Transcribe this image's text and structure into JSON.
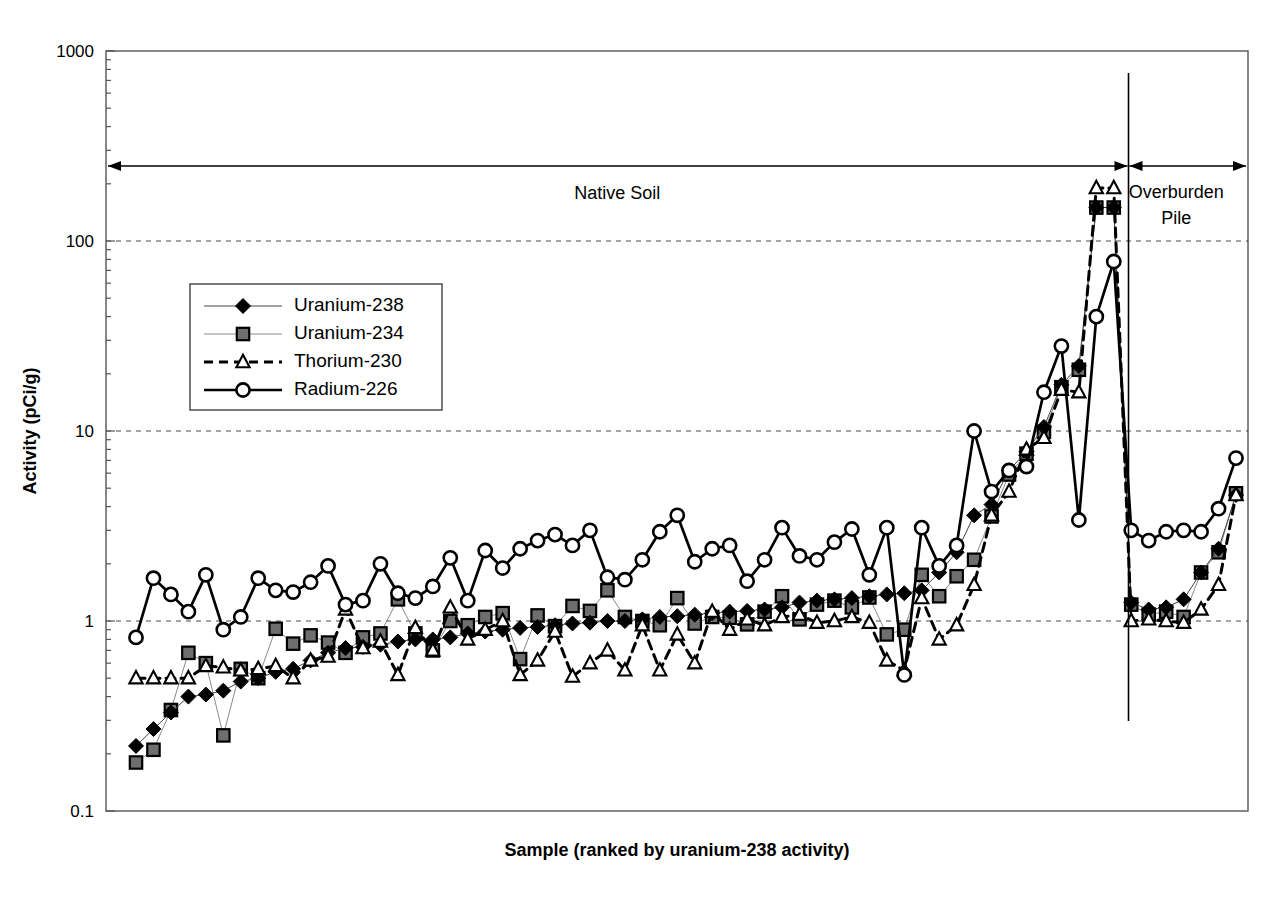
{
  "figure": {
    "background_color": "#ffffff",
    "line_color": "#000000"
  },
  "chart_data": {
    "type": "line",
    "title": "",
    "subtitle": "",
    "xlabel": "Sample (ranked by uranium-238 activity)",
    "ylabel": "Activity (pCi/g)",
    "yscale": "log",
    "ylim": [
      0.1,
      1000
    ],
    "ytick_labels": [
      "1000",
      "100",
      "10",
      "1",
      "0.1"
    ],
    "ytick_values": [
      1000,
      100,
      10,
      1,
      0.1
    ],
    "grid": "horizontal-dashed-at-decades",
    "xlim": [
      1,
      60
    ],
    "xticks_shown": false,
    "legend_position": "upper-left-inside",
    "series": [
      {
        "name": "Uranium-238",
        "marker": "filled-diamond",
        "line": "solid-thin",
        "color": "#000000",
        "values": [
          0.22,
          0.27,
          0.33,
          0.4,
          0.41,
          0.43,
          0.48,
          0.5,
          0.54,
          0.56,
          0.62,
          0.68,
          0.72,
          0.73,
          0.75,
          0.78,
          0.8,
          0.8,
          0.82,
          0.86,
          0.88,
          0.9,
          0.92,
          0.93,
          0.95,
          0.97,
          0.98,
          1.0,
          1.0,
          1.02,
          1.05,
          1.06,
          1.08,
          1.1,
          1.12,
          1.13,
          1.15,
          1.18,
          1.25,
          1.28,
          1.3,
          1.32,
          1.35,
          1.38,
          1.4,
          1.45,
          1.8,
          2.3,
          3.6,
          4.1,
          6.2,
          7.8,
          10.5,
          17.5,
          22.0,
          150.0,
          150.0,
          1.25,
          1.15,
          1.18,
          1.3,
          1.8,
          2.4,
          4.6
        ]
      },
      {
        "name": "Uranium-234",
        "marker": "gray-square",
        "line": "solid-thin-light",
        "color": "#555555",
        "values": [
          0.18,
          0.21,
          0.34,
          0.68,
          0.6,
          0.25,
          0.56,
          0.5,
          0.91,
          0.76,
          0.84,
          0.77,
          0.68,
          0.82,
          0.86,
          1.3,
          0.86,
          0.7,
          1.0,
          0.95,
          1.05,
          1.1,
          0.63,
          1.07,
          0.94,
          1.2,
          1.13,
          1.45,
          1.05,
          1.0,
          0.95,
          1.32,
          0.97,
          1.05,
          1.04,
          0.96,
          1.12,
          1.35,
          1.02,
          1.22,
          1.28,
          1.18,
          1.33,
          0.85,
          0.9,
          1.75,
          1.35,
          1.72,
          2.1,
          3.55,
          5.9,
          7.6,
          9.9,
          17.0,
          21.0,
          150.0,
          150.0,
          1.22,
          1.08,
          1.12,
          1.05,
          1.8,
          2.3,
          4.7
        ]
      },
      {
        "name": "Thorium-230",
        "marker": "open-triangle",
        "line": "dashed",
        "color": "#000000",
        "values": [
          0.5,
          0.5,
          0.5,
          0.5,
          0.58,
          0.57,
          0.55,
          0.56,
          0.58,
          0.5,
          0.62,
          0.65,
          1.15,
          0.72,
          0.78,
          0.52,
          0.92,
          0.7,
          1.18,
          0.8,
          0.9,
          1.0,
          0.52,
          0.62,
          0.88,
          0.51,
          0.6,
          0.7,
          0.55,
          0.95,
          0.55,
          0.85,
          0.6,
          1.12,
          0.9,
          1.02,
          0.95,
          1.05,
          1.08,
          0.98,
          1.0,
          1.05,
          0.98,
          0.62,
          0.55,
          1.32,
          0.8,
          0.95,
          1.55,
          3.6,
          4.8,
          8.0,
          9.2,
          16.5,
          16.0,
          190.0,
          190.0,
          1.0,
          1.02,
          1.0,
          0.98,
          1.15,
          1.55,
          4.6
        ]
      },
      {
        "name": "Radium-226",
        "marker": "open-circle",
        "line": "solid-bold",
        "color": "#000000",
        "values": [
          0.82,
          1.68,
          1.38,
          1.12,
          1.75,
          0.9,
          1.05,
          1.68,
          1.45,
          1.42,
          1.6,
          1.95,
          1.22,
          1.28,
          2.0,
          1.4,
          1.32,
          1.52,
          2.15,
          1.28,
          2.35,
          1.9,
          2.4,
          2.65,
          2.85,
          2.5,
          3.0,
          1.7,
          1.65,
          2.1,
          2.95,
          3.6,
          2.05,
          2.4,
          2.5,
          1.62,
          2.1,
          3.1,
          2.2,
          2.1,
          2.6,
          3.05,
          1.75,
          3.1,
          0.52,
          3.1,
          1.95,
          2.5,
          10.0,
          4.8,
          6.2,
          6.5,
          16.0,
          28.0,
          3.4,
          40.0,
          78.0,
          3.0,
          2.65,
          2.95,
          3.0,
          2.95,
          3.9,
          7.2
        ]
      }
    ],
    "annotations": [
      {
        "id": "native-soil",
        "label": "Native Soil",
        "type": "double-arrow-span",
        "from_x": 1,
        "to_x": 57
      },
      {
        "id": "overburden-pile",
        "label": "Overburden\nPile",
        "label_line1": "Overburden",
        "label_line2": "Pile",
        "type": "double-arrow-span",
        "from_x": 57,
        "to_x": 60
      },
      {
        "id": "region-divider",
        "type": "vertical-line",
        "at_x": 57
      }
    ]
  },
  "legend": {
    "entries": [
      {
        "label": "Uranium-238",
        "marker": "filled-diamond"
      },
      {
        "label": "Uranium-234",
        "marker": "gray-square"
      },
      {
        "label": "Thorium-230",
        "marker": "open-triangle"
      },
      {
        "label": "Radium-226",
        "marker": "open-circle"
      }
    ]
  }
}
